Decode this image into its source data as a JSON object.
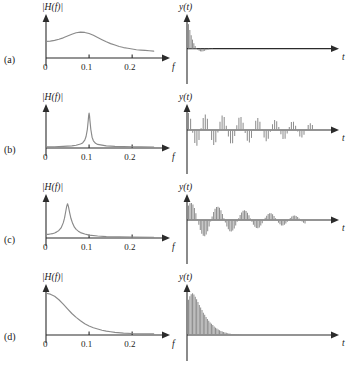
{
  "figure": {
    "ylabel_freq": "|H(f)|",
    "xlabel_freq": "f",
    "ylabel_time": "y(t)",
    "xlabel_time": "t",
    "freq_ticks": [
      "0",
      "0.1",
      "0.2"
    ],
    "curve_color": "#8a8a8a",
    "stem_color": "#8f8f8f",
    "axis_color": "#2b2b2b"
  },
  "rows": [
    {
      "label": "(a)",
      "peak_freq": 0.085,
      "q": "low",
      "freq_note": "broad low-frequency hump, slowly rolling off"
    },
    {
      "label": "(b)",
      "peak_freq": 0.1,
      "q": "very-high",
      "freq_note": "very sharp narrow resonance at 0.1"
    },
    {
      "label": "(c)",
      "peak_freq": 0.05,
      "q": "high",
      "freq_note": "sharp resonance at 0.05, moderate width"
    },
    {
      "label": "(d)",
      "peak_freq": 0.0,
      "q": "lowpass",
      "freq_note": "lowpass, maximum at DC decaying to zero"
    }
  ],
  "chart_data": [
    {
      "type": "line",
      "panel": "a-left",
      "title": "",
      "xlabel": "f",
      "ylabel": "|H(f)|",
      "xlim": [
        0,
        0.26
      ],
      "ylim": [
        0,
        1
      ],
      "xticks": [
        0,
        0.1,
        0.2
      ],
      "grid": false,
      "x": [
        0.0,
        0.01,
        0.02,
        0.03,
        0.04,
        0.05,
        0.06,
        0.07,
        0.08,
        0.09,
        0.1,
        0.11,
        0.12,
        0.13,
        0.14,
        0.15,
        0.16,
        0.17,
        0.18,
        0.19,
        0.2,
        0.21,
        0.22,
        0.23,
        0.24,
        0.25
      ],
      "values": [
        0.46,
        0.47,
        0.49,
        0.52,
        0.56,
        0.61,
        0.66,
        0.7,
        0.72,
        0.71,
        0.68,
        0.63,
        0.57,
        0.51,
        0.45,
        0.4,
        0.36,
        0.32,
        0.29,
        0.27,
        0.25,
        0.23,
        0.22,
        0.21,
        0.2,
        0.19
      ]
    },
    {
      "type": "bar",
      "panel": "a-right",
      "xlabel": "t",
      "ylabel": "y(t)",
      "xlim": [
        0,
        60
      ],
      "ylim": [
        -0.35,
        1
      ],
      "grid": false,
      "categories": [
        0,
        1,
        2,
        3,
        4,
        5,
        6,
        7,
        8,
        9,
        10,
        11,
        12,
        13,
        14,
        15,
        16,
        17,
        18,
        19,
        20,
        21,
        22,
        23,
        24,
        25,
        26,
        27,
        28,
        29
      ],
      "values": [
        0.92,
        0.7,
        0.5,
        0.34,
        0.2,
        0.1,
        0.02,
        -0.04,
        -0.08,
        -0.1,
        -0.11,
        -0.1,
        -0.08,
        -0.06,
        -0.04,
        -0.03,
        -0.02,
        -0.01,
        -0.01,
        0.0,
        0.0,
        0.0,
        0.0,
        0.0,
        0.0,
        0.0,
        0.0,
        0.0,
        0.0,
        0.0
      ]
    },
    {
      "type": "line",
      "panel": "b-left",
      "xlabel": "f",
      "ylabel": "|H(f)|",
      "xlim": [
        0,
        0.26
      ],
      "ylim": [
        0,
        1
      ],
      "xticks": [
        0,
        0.1,
        0.2
      ],
      "grid": false,
      "x": [
        0.0,
        0.02,
        0.04,
        0.06,
        0.07,
        0.08,
        0.085,
        0.09,
        0.093,
        0.096,
        0.098,
        0.099,
        0.1,
        0.101,
        0.102,
        0.104,
        0.107,
        0.11,
        0.115,
        0.12,
        0.14,
        0.16,
        0.18,
        0.2,
        0.22,
        0.25
      ],
      "values": [
        0.03,
        0.035,
        0.045,
        0.06,
        0.075,
        0.11,
        0.14,
        0.22,
        0.32,
        0.52,
        0.76,
        0.9,
        0.97,
        0.9,
        0.76,
        0.52,
        0.3,
        0.2,
        0.13,
        0.1,
        0.06,
        0.045,
        0.04,
        0.035,
        0.03,
        0.028
      ]
    },
    {
      "type": "bar",
      "panel": "b-right",
      "xlabel": "t",
      "ylabel": "y(t)",
      "xlim": [
        0,
        60
      ],
      "ylim": [
        -1,
        1
      ],
      "grid": false,
      "categories": [
        0,
        1,
        2,
        3,
        4,
        5,
        6,
        7,
        8,
        9,
        10,
        11,
        12,
        13,
        14,
        15,
        16,
        17,
        18,
        19,
        20,
        21,
        22,
        23,
        24,
        25,
        26,
        27,
        28,
        29,
        30,
        31,
        32,
        33,
        34,
        35,
        36,
        37,
        38,
        39,
        40,
        41,
        42,
        43,
        44,
        45,
        46,
        47,
        48,
        49,
        50,
        51,
        52,
        53,
        54,
        55,
        56,
        57,
        58,
        59
      ],
      "values": [
        0.95,
        0.62,
        -0.15,
        -0.72,
        -0.88,
        -0.55,
        0.1,
        0.66,
        0.86,
        0.62,
        0.02,
        -0.56,
        -0.84,
        -0.68,
        -0.14,
        0.46,
        0.8,
        0.72,
        0.24,
        -0.36,
        -0.74,
        -0.74,
        -0.34,
        0.26,
        0.68,
        0.72,
        0.4,
        -0.16,
        -0.6,
        -0.7,
        -0.44,
        0.06,
        0.52,
        0.66,
        0.46,
        0.02,
        -0.42,
        -0.62,
        -0.48,
        -0.1,
        0.32,
        0.56,
        0.48,
        0.16,
        -0.24,
        -0.5,
        -0.48,
        -0.2,
        0.16,
        0.44,
        0.46,
        0.24,
        -0.08,
        -0.36,
        -0.42,
        -0.26,
        0.02,
        0.28,
        0.38,
        0.28
      ]
    },
    {
      "type": "line",
      "panel": "c-left",
      "xlabel": "f",
      "ylabel": "|H(f)|",
      "xlim": [
        0,
        0.26
      ],
      "ylim": [
        0,
        1
      ],
      "xticks": [
        0,
        0.1,
        0.2
      ],
      "grid": false,
      "x": [
        0.0,
        0.005,
        0.01,
        0.015,
        0.02,
        0.025,
        0.03,
        0.035,
        0.04,
        0.043,
        0.046,
        0.048,
        0.05,
        0.052,
        0.055,
        0.058,
        0.062,
        0.066,
        0.07,
        0.075,
        0.08,
        0.09,
        0.1,
        0.12,
        0.14,
        0.17,
        0.2,
        0.25
      ],
      "values": [
        0.1,
        0.1,
        0.11,
        0.12,
        0.14,
        0.17,
        0.21,
        0.28,
        0.42,
        0.55,
        0.75,
        0.88,
        0.95,
        0.88,
        0.7,
        0.54,
        0.4,
        0.3,
        0.24,
        0.19,
        0.15,
        0.11,
        0.08,
        0.055,
        0.04,
        0.03,
        0.025,
        0.02
      ]
    },
    {
      "type": "bar",
      "panel": "c-right",
      "xlabel": "t",
      "ylabel": "y(t)",
      "xlim": [
        0,
        60
      ],
      "ylim": [
        -1,
        1
      ],
      "grid": false,
      "categories": [
        0,
        1,
        2,
        3,
        4,
        5,
        6,
        7,
        8,
        9,
        10,
        11,
        12,
        13,
        14,
        15,
        16,
        17,
        18,
        19,
        20,
        21,
        22,
        23,
        24,
        25,
        26,
        27,
        28,
        29,
        30,
        31,
        32,
        33,
        34,
        35,
        36,
        37,
        38,
        39,
        40,
        41,
        42,
        43,
        44,
        45,
        46,
        47,
        48,
        49,
        50,
        51,
        52,
        53,
        54,
        55,
        56,
        57,
        58,
        59,
        60,
        61,
        62,
        63,
        64,
        65,
        66,
        67,
        68,
        69,
        70,
        71,
        72,
        73,
        74,
        75,
        76,
        77,
        78,
        79
      ],
      "values": [
        0.8,
        0.93,
        0.95,
        0.86,
        0.66,
        0.38,
        0.06,
        -0.27,
        -0.55,
        -0.76,
        -0.88,
        -0.9,
        -0.8,
        -0.62,
        -0.36,
        -0.08,
        0.2,
        0.44,
        0.62,
        0.72,
        0.74,
        0.68,
        0.54,
        0.34,
        0.1,
        -0.14,
        -0.36,
        -0.52,
        -0.62,
        -0.64,
        -0.59,
        -0.47,
        -0.3,
        -0.1,
        0.1,
        0.28,
        0.42,
        0.51,
        0.54,
        0.5,
        0.4,
        0.26,
        0.08,
        -0.1,
        -0.26,
        -0.38,
        -0.45,
        -0.46,
        -0.41,
        -0.31,
        -0.18,
        -0.03,
        0.12,
        0.24,
        0.33,
        0.38,
        0.37,
        0.32,
        0.22,
        0.1,
        -0.03,
        -0.15,
        -0.24,
        -0.3,
        -0.31,
        -0.27,
        -0.2,
        -0.1,
        0.01,
        0.11,
        0.19,
        0.24,
        0.25,
        0.22,
        0.16,
        0.08,
        -0.01,
        -0.09,
        -0.15,
        -0.19
      ]
    },
    {
      "type": "line",
      "panel": "d-left",
      "xlabel": "f",
      "ylabel": "|H(f)|",
      "xlim": [
        0,
        0.26
      ],
      "ylim": [
        0,
        1
      ],
      "xticks": [
        0,
        0.1,
        0.2
      ],
      "grid": false,
      "x": [
        0.0,
        0.01,
        0.02,
        0.03,
        0.04,
        0.05,
        0.06,
        0.07,
        0.08,
        0.09,
        0.1,
        0.11,
        0.12,
        0.13,
        0.14,
        0.15,
        0.16,
        0.18,
        0.2,
        0.22,
        0.25
      ],
      "values": [
        0.97,
        0.95,
        0.9,
        0.82,
        0.72,
        0.61,
        0.5,
        0.41,
        0.33,
        0.26,
        0.21,
        0.17,
        0.14,
        0.11,
        0.09,
        0.075,
        0.06,
        0.045,
        0.035,
        0.03,
        0.025
      ]
    },
    {
      "type": "bar",
      "panel": "d-right",
      "xlabel": "t",
      "ylabel": "y(t)",
      "xlim": [
        0,
        60
      ],
      "ylim": [
        0,
        1
      ],
      "grid": false,
      "categories": [
        0,
        1,
        2,
        3,
        4,
        5,
        6,
        7,
        8,
        9,
        10,
        11,
        12,
        13,
        14,
        15,
        16,
        17,
        18,
        19,
        20,
        21,
        22,
        23,
        24,
        25,
        26,
        27,
        28,
        29,
        30,
        31,
        32,
        33,
        34,
        35,
        36,
        37,
        38,
        39
      ],
      "values": [
        0.82,
        0.9,
        0.95,
        0.97,
        0.94,
        0.89,
        0.83,
        0.77,
        0.7,
        0.64,
        0.58,
        0.52,
        0.47,
        0.42,
        0.37,
        0.33,
        0.29,
        0.26,
        0.23,
        0.2,
        0.17,
        0.15,
        0.13,
        0.11,
        0.095,
        0.082,
        0.07,
        0.06,
        0.051,
        0.043,
        0.036,
        0.03,
        0.025,
        0.021,
        0.017,
        0.014,
        0.011,
        0.009,
        0.007,
        0.005
      ]
    }
  ]
}
